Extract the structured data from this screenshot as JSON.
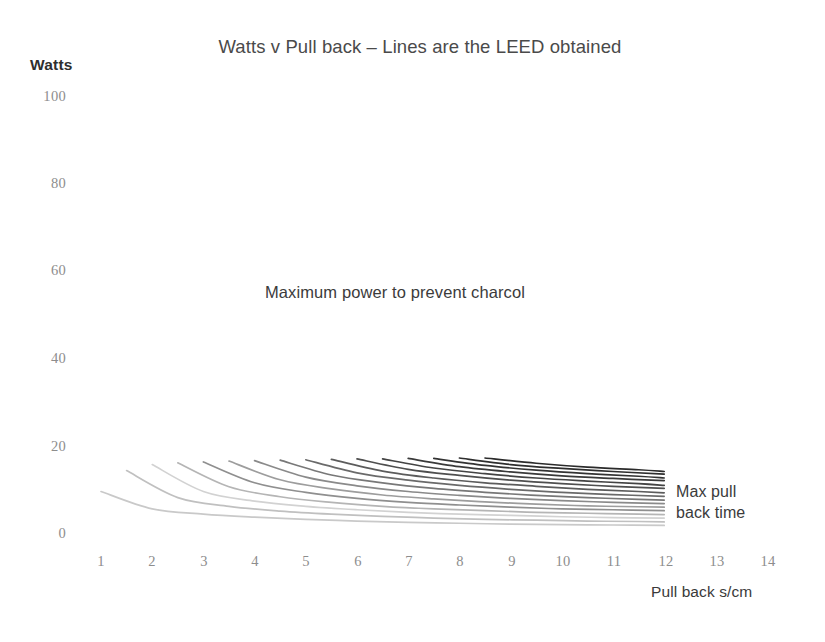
{
  "title": "Watts v Pull back – Lines are the LEED obtained",
  "y_axis_title": "Watts",
  "x_axis_title": "Pull back s/cm",
  "annotations": {
    "center": "Maximum power to prevent charcol",
    "right_line1": "Max pull",
    "right_line2": "back time"
  },
  "colors": {
    "background": "#ffffff",
    "title_text": "#4a4a4a",
    "tick_text": "#8d8d8d",
    "annotation_text": "#3b3b3b",
    "line_lightest": "#d8d8d8",
    "line_darkest": "#2b2b2b"
  },
  "chart_data": {
    "type": "line",
    "title": "Watts v Pull back – Lines are the LEED obtained",
    "xlabel": "Pull back s/cm",
    "ylabel": "Watts",
    "xlim": [
      0.4,
      14.6
    ],
    "ylim": [
      0,
      100
    ],
    "yticks": [
      0,
      20,
      40,
      60,
      80,
      100
    ],
    "xticks": [
      1,
      2,
      3,
      4,
      5,
      6,
      7,
      8,
      9,
      10,
      11,
      12,
      13,
      14
    ],
    "grid": false,
    "legend": false,
    "annotations": [
      {
        "text": "Maximum power to prevent charcol",
        "x": 5.6,
        "y": 57
      },
      {
        "text": "Max pull back time",
        "x": 12.4,
        "y": 9
      }
    ],
    "series": [
      {
        "name": "LEED 1",
        "color": "#c9c9c9",
        "x": [
          1,
          2,
          3,
          4,
          5,
          6,
          7,
          8,
          9,
          10,
          11,
          12
        ],
        "y": [
          10.0,
          6.0,
          4.8,
          4.1,
          3.6,
          3.2,
          2.9,
          2.7,
          2.5,
          2.4,
          2.3,
          2.2
        ]
      },
      {
        "name": "LEED 2",
        "color": "#c0c0c0",
        "x": [
          1.5,
          2.5,
          3.5,
          4.5,
          5.5,
          6.5,
          7.5,
          8.5,
          9.5,
          10.5,
          11.5,
          12
        ],
        "y": [
          14.8,
          8.6,
          6.6,
          5.5,
          4.8,
          4.3,
          3.9,
          3.6,
          3.4,
          3.2,
          3.1,
          3.0
        ]
      },
      {
        "name": "LEED 3",
        "color": "#d2d2d2",
        "x": [
          2,
          3,
          4,
          5,
          6,
          7,
          8,
          9,
          10,
          11,
          12
        ],
        "y": [
          16.2,
          10.0,
          7.8,
          6.6,
          5.8,
          5.2,
          4.8,
          4.5,
          4.2,
          4.0,
          3.9
        ]
      },
      {
        "name": "LEED 4",
        "color": "#b5b5b5",
        "x": [
          2.5,
          3.5,
          4.5,
          5.5,
          6.5,
          7.5,
          8.5,
          9.5,
          10.5,
          11.5,
          12
        ],
        "y": [
          16.6,
          11.1,
          8.8,
          7.5,
          6.6,
          6.0,
          5.6,
          5.2,
          5.0,
          4.8,
          4.7
        ]
      },
      {
        "name": "LEED 5",
        "color": "#8f8f8f",
        "x": [
          3,
          4,
          5,
          6,
          7,
          8,
          9,
          10,
          11,
          12
        ],
        "y": [
          16.8,
          12.0,
          9.8,
          8.4,
          7.5,
          6.9,
          6.4,
          6.0,
          5.8,
          5.6
        ]
      },
      {
        "name": "LEED 6",
        "color": "#9d9d9d",
        "x": [
          3.5,
          4.5,
          5.5,
          6.5,
          7.5,
          8.5,
          9.5,
          10.5,
          11.5,
          12
        ],
        "y": [
          17.0,
          12.7,
          10.6,
          9.2,
          8.3,
          7.6,
          7.1,
          6.7,
          6.5,
          6.4
        ]
      },
      {
        "name": "LEED 7",
        "color": "#8a8a8a",
        "x": [
          4,
          5,
          6,
          7,
          8,
          9,
          10,
          11,
          12
        ],
        "y": [
          17.1,
          13.3,
          11.3,
          10.0,
          9.1,
          8.4,
          7.9,
          7.5,
          7.2
        ]
      },
      {
        "name": "LEED 8",
        "color": "#787878",
        "x": [
          4.5,
          5.5,
          6.5,
          7.5,
          8.5,
          9.5,
          10.5,
          11.5,
          12
        ],
        "y": [
          17.2,
          13.8,
          12.0,
          10.7,
          9.8,
          9.1,
          8.6,
          8.2,
          8.0
        ]
      },
      {
        "name": "LEED 9",
        "color": "#6a6a6a",
        "x": [
          5,
          6,
          7,
          8,
          9,
          10,
          11,
          12
        ],
        "y": [
          17.3,
          14.3,
          12.6,
          11.4,
          10.5,
          9.8,
          9.3,
          8.9
        ]
      },
      {
        "name": "LEED 10",
        "color": "#5c5c5c",
        "x": [
          5.5,
          6.5,
          7.5,
          8.5,
          9.5,
          10.5,
          11.5,
          12
        ],
        "y": [
          17.4,
          14.7,
          13.1,
          12.0,
          11.2,
          10.5,
          10.0,
          9.7
        ]
      },
      {
        "name": "LEED 11",
        "color": "#4f4f4f",
        "x": [
          6,
          7,
          8,
          9,
          10,
          11,
          12
        ],
        "y": [
          17.5,
          15.1,
          13.7,
          12.6,
          11.8,
          11.2,
          10.7
        ]
      },
      {
        "name": "LEED 12",
        "color": "#444444",
        "x": [
          6.5,
          7.5,
          8.5,
          9.5,
          10.5,
          11.5,
          12
        ],
        "y": [
          17.5,
          15.4,
          14.1,
          13.1,
          12.4,
          11.8,
          11.4
        ]
      },
      {
        "name": "LEED 13",
        "color": "#3a3a3a",
        "x": [
          7,
          8,
          9,
          10,
          11,
          12
        ],
        "y": [
          17.6,
          15.7,
          14.5,
          13.6,
          13.0,
          12.5
        ]
      },
      {
        "name": "LEED 14",
        "color": "#333333",
        "x": [
          7.5,
          8.5,
          9.5,
          10.5,
          11.5,
          12
        ],
        "y": [
          17.6,
          16.0,
          14.9,
          14.1,
          13.5,
          13.1
        ]
      },
      {
        "name": "LEED 15",
        "color": "#2e2e2e",
        "x": [
          8,
          9,
          10,
          11,
          12
        ],
        "y": [
          17.7,
          16.2,
          15.3,
          14.6,
          14.0
        ]
      },
      {
        "name": "LEED 16",
        "color": "#2b2b2b",
        "x": [
          8.5,
          9.5,
          10.5,
          11.5,
          12
        ],
        "y": [
          17.7,
          16.5,
          15.6,
          15.0,
          14.6
        ]
      }
    ]
  }
}
